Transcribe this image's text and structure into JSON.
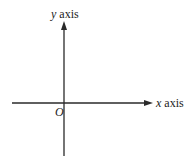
{
  "diagram": {
    "type": "cartesian-axes",
    "axes": {
      "x": {
        "variable": "x",
        "word": "axis"
      },
      "y": {
        "variable": "y",
        "word": "axis"
      }
    },
    "origin_label": "O",
    "colors": {
      "line": "#2a2a2a",
      "text": "#222222",
      "background": "#ffffff"
    }
  }
}
